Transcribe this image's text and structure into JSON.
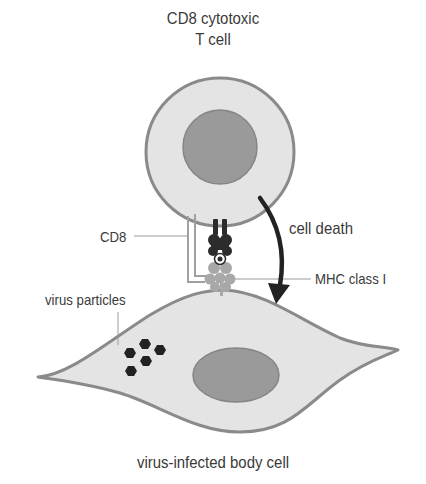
{
  "diagram": {
    "title_line1": "CD8 cytotoxic",
    "title_line2": "T cell",
    "labels": {
      "cd8": "CD8",
      "cell_death": "cell death",
      "mhc": "MHC class I",
      "virus": "virus particles",
      "body_cell": "virus-infected body cell"
    },
    "colors": {
      "background": "#ffffff",
      "cytoplasm": "#e4e4e4",
      "membrane": "#8a8a8a",
      "nucleus": "#9a9a9a",
      "receptor_dark": "#2c2c2c",
      "mhc_gray": "#a8a8a8",
      "virus": "#222222",
      "arrow": "#222222",
      "leader": "#9a9a9a",
      "text": "#3a3a3a"
    },
    "virus_particle_count": 5
  }
}
